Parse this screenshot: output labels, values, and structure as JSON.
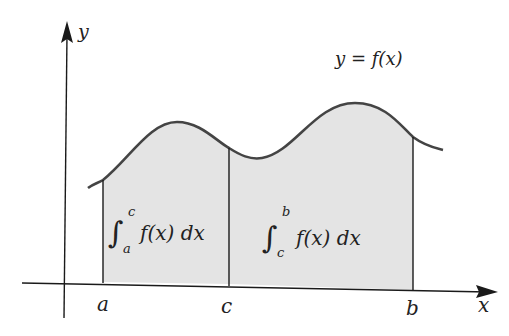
{
  "figure": {
    "curve_label": "y = f(x)",
    "fill_color": "#e4e4e4",
    "line_color": "#1a1a1a",
    "curve_color": "#444444"
  },
  "axes": {
    "x_label": "x",
    "y_label": "y"
  },
  "ticks": {
    "a": "a",
    "c": "c",
    "b": "b"
  },
  "integrals": {
    "left": {
      "lower": "a",
      "upper": "c",
      "integrand": "f(x) dx"
    },
    "right": {
      "lower": "c",
      "upper": "b",
      "integrand": "f(x) dx"
    }
  }
}
